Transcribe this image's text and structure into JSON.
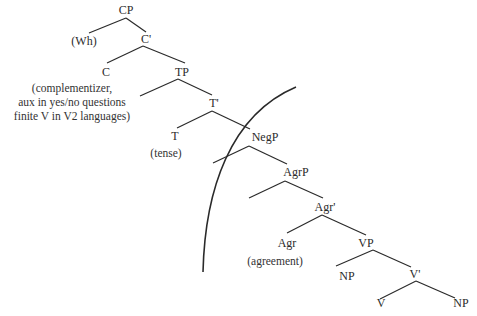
{
  "diagram": {
    "type": "syntax-tree",
    "nodes": {
      "cp": "CP",
      "wh": "(Wh)",
      "c_bar": "C'",
      "c": "C",
      "tp": "TP",
      "t_bar": "T'",
      "t": "T",
      "negp": "NegP",
      "agrp": "AgrP",
      "agr_bar": "Agr'",
      "agr": "Agr",
      "vp": "VP",
      "vp_np": "NP",
      "v_bar": "V'",
      "v": "V",
      "object_np": "NP"
    },
    "annotations": {
      "c_note": [
        "(complementizer,",
        "aux in yes/no questions",
        "finite V in V2 languages)"
      ],
      "t_note": "(tense)",
      "agr_note": "(agreement)"
    },
    "edges": [
      [
        "CP",
        "(Wh)"
      ],
      [
        "CP",
        "C'"
      ],
      [
        "C'",
        "C"
      ],
      [
        "C'",
        "TP"
      ],
      [
        "TP",
        "spec-TP"
      ],
      [
        "TP",
        "T'"
      ],
      [
        "T'",
        "T"
      ],
      [
        "T'",
        "NegP"
      ],
      [
        "NegP",
        "spec-NegP"
      ],
      [
        "NegP",
        "AgrP"
      ],
      [
        "AgrP",
        "spec-AgrP"
      ],
      [
        "AgrP",
        "Agr'"
      ],
      [
        "Agr'",
        "Agr"
      ],
      [
        "Agr'",
        "VP"
      ],
      [
        "VP",
        "NP"
      ],
      [
        "VP",
        "V'"
      ],
      [
        "V'",
        "V"
      ],
      [
        "V'",
        "NP"
      ]
    ],
    "colors": {
      "ink": "#2a2a2a",
      "background": "#ffffff"
    }
  }
}
